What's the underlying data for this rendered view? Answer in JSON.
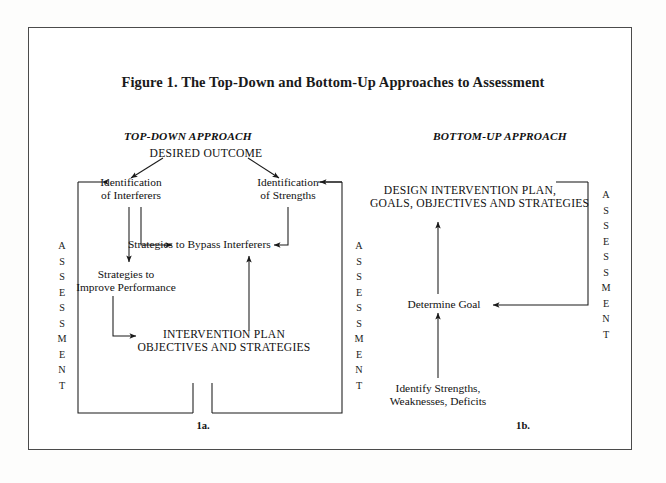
{
  "figure": {
    "title": "Figure 1. The Top-Down and Bottom-Up Approaches to Assessment",
    "page_background": "#ffffff",
    "ink_color": "#111111",
    "frame_color": "#4b4b4b"
  },
  "panels": {
    "left": {
      "heading": "TOP-DOWN APPROACH",
      "number": "1a.",
      "assessment_label": "ASSESSMENT",
      "nodes": {
        "desired_outcome": "DESIRED OUTCOME",
        "identification_interferers": "Identification\nof Interferers",
        "identification_strengths": "Identification\nof Strengths",
        "bypass_strategies": "Strategies to Bypass Interferers",
        "improve_strategies": "Strategies to\nImprove Performance",
        "intervention_plan": "INTERVENTION PLAN\nOBJECTIVES AND STRATEGIES"
      }
    },
    "right": {
      "heading": "BOTTOM-UP APPROACH",
      "number": "1b.",
      "assessment_label": "ASSESSMENT",
      "nodes": {
        "design_plan": "DESIGN INTERVENTION PLAN,\nGOALS, OBJECTIVES AND STRATEGIES",
        "determine_goal": "Determine Goal",
        "identify_strengths": "Identify Strengths,\nWeaknesses, Deficits"
      }
    }
  },
  "assessment_letters": [
    "A",
    "S",
    "S",
    "E",
    "S",
    "S",
    "M",
    "E",
    "N",
    "T"
  ]
}
